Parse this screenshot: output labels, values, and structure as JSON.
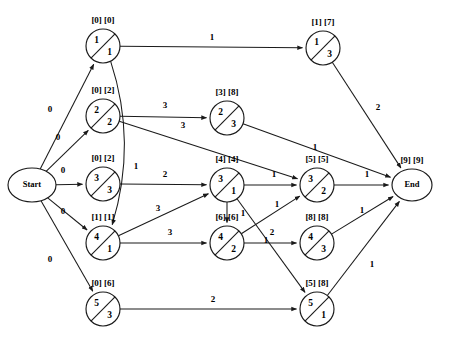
{
  "diagram": {
    "stroke_color": "#1a1a1a",
    "background": "#ffffff"
  },
  "chart_data": {
    "type": "diagram",
    "notation": "node circle split by diagonal: upper-left = activity number, lower-right = duration; bracket pair above node = [earliest] [latest]",
    "nodes": [
      {
        "id": "start",
        "label": "Start",
        "shape": "ellipse",
        "cx": 32,
        "cy": 185,
        "rx": 24,
        "ry": 17,
        "top": "",
        "bottom": "",
        "bracket": ""
      },
      {
        "id": "n1",
        "label": "",
        "shape": "circle",
        "cx": 103,
        "cy": 46,
        "r": 17,
        "top": "1",
        "bottom": "1",
        "bracket": "[0] [0]"
      },
      {
        "id": "n2",
        "label": "",
        "shape": "circle",
        "cx": 103,
        "cy": 116,
        "r": 17,
        "top": "2",
        "bottom": "2",
        "bracket": "[0] [2]"
      },
      {
        "id": "n3",
        "label": "",
        "shape": "circle",
        "cx": 103,
        "cy": 184,
        "r": 17,
        "top": "3",
        "bottom": "3",
        "bracket": "[0] [2]"
      },
      {
        "id": "n4",
        "label": "",
        "shape": "circle",
        "cx": 103,
        "cy": 243,
        "r": 17,
        "top": "4",
        "bottom": "1",
        "bracket": "[1] [1]"
      },
      {
        "id": "n5",
        "label": "",
        "shape": "circle",
        "cx": 103,
        "cy": 309,
        "r": 17,
        "top": "5",
        "bottom": "3",
        "bracket": "[0] [6]"
      },
      {
        "id": "m1",
        "label": "",
        "shape": "circle",
        "cx": 323,
        "cy": 48,
        "r": 17,
        "top": "1",
        "bottom": "3",
        "bracket": "[1] [7]"
      },
      {
        "id": "m2",
        "label": "",
        "shape": "circle",
        "cx": 227,
        "cy": 118,
        "r": 17,
        "top": "2",
        "bottom": "3",
        "bracket": "[3] [8]"
      },
      {
        "id": "m3",
        "label": "",
        "shape": "circle",
        "cx": 227,
        "cy": 185,
        "r": 17,
        "top": "3",
        "bottom": "1",
        "bracket": "[4] [4]"
      },
      {
        "id": "m4",
        "label": "",
        "shape": "circle",
        "cx": 227,
        "cy": 243,
        "r": 17,
        "top": "4",
        "bottom": "2",
        "bracket": "[6] [6]"
      },
      {
        "id": "m5",
        "label": "",
        "shape": "circle",
        "cx": 317,
        "cy": 309,
        "r": 17,
        "top": "5",
        "bottom": "1",
        "bracket": "[5] [8]"
      },
      {
        "id": "p3",
        "label": "",
        "shape": "circle",
        "cx": 317,
        "cy": 185,
        "r": 17,
        "top": "3",
        "bottom": "2",
        "bracket": "[5] [5]"
      },
      {
        "id": "p4",
        "label": "",
        "shape": "circle",
        "cx": 317,
        "cy": 243,
        "r": 17,
        "top": "4",
        "bottom": "3",
        "bracket": "[8] [8]"
      },
      {
        "id": "end",
        "label": "End",
        "shape": "ellipse",
        "cx": 412,
        "cy": 185,
        "rx": 20,
        "ry": 16,
        "top": "",
        "bottom": "",
        "bracket": "[9] [9]"
      }
    ],
    "edges": [
      {
        "from": "start",
        "to": "n1",
        "weight": "0",
        "lx": 50,
        "ly": 112
      },
      {
        "from": "start",
        "to": "n2",
        "weight": "0",
        "lx": 58,
        "ly": 140
      },
      {
        "from": "start",
        "to": "n3",
        "weight": "0",
        "lx": 63,
        "ly": 173
      },
      {
        "from": "start",
        "to": "n4",
        "weight": "0",
        "lx": 63,
        "ly": 214
      },
      {
        "from": "start",
        "to": "n5",
        "weight": "0",
        "lx": 50,
        "ly": 262
      },
      {
        "from": "n1",
        "to": "m1",
        "weight": "1",
        "lx": 212,
        "ly": 40
      },
      {
        "from": "n1",
        "to": "n4",
        "weight": "1",
        "lx": 136,
        "ly": 169,
        "curve": true
      },
      {
        "from": "n2",
        "to": "m2",
        "weight": "3",
        "lx": 165,
        "ly": 108
      },
      {
        "from": "n2",
        "to": "p3",
        "weight": "3",
        "lx": 183,
        "ly": 128
      },
      {
        "from": "n3",
        "to": "m3",
        "weight": "2",
        "lx": 165,
        "ly": 177
      },
      {
        "from": "n4",
        "to": "m3",
        "weight": "3",
        "lx": 158,
        "ly": 211
      },
      {
        "from": "n4",
        "to": "m4",
        "weight": "3",
        "lx": 170,
        "ly": 235
      },
      {
        "from": "n5",
        "to": "m5",
        "weight": "2",
        "lx": 213,
        "ly": 302
      },
      {
        "from": "m1",
        "to": "end",
        "weight": "2",
        "lx": 378,
        "ly": 110
      },
      {
        "from": "m2",
        "to": "end",
        "weight": "1",
        "lx": 315,
        "ly": 150
      },
      {
        "from": "m3",
        "to": "p3",
        "weight": "1",
        "lx": 274,
        "ly": 177
      },
      {
        "from": "m3",
        "to": "m4",
        "weight": "1",
        "lx": 243,
        "ly": 216
      },
      {
        "from": "m3",
        "to": "m5",
        "weight": "1",
        "lx": 266,
        "ly": 243
      },
      {
        "from": "m4",
        "to": "p3",
        "weight": "1",
        "lx": 277,
        "ly": 207
      },
      {
        "from": "m4",
        "to": "p4",
        "weight": "2",
        "lx": 272,
        "ly": 235
      },
      {
        "from": "p3",
        "to": "end",
        "weight": "1",
        "lx": 367,
        "ly": 177
      },
      {
        "from": "p4",
        "to": "end",
        "weight": "1",
        "lx": 362,
        "ly": 213
      },
      {
        "from": "m5",
        "to": "end",
        "weight": "1",
        "lx": 372,
        "ly": 267
      }
    ]
  }
}
